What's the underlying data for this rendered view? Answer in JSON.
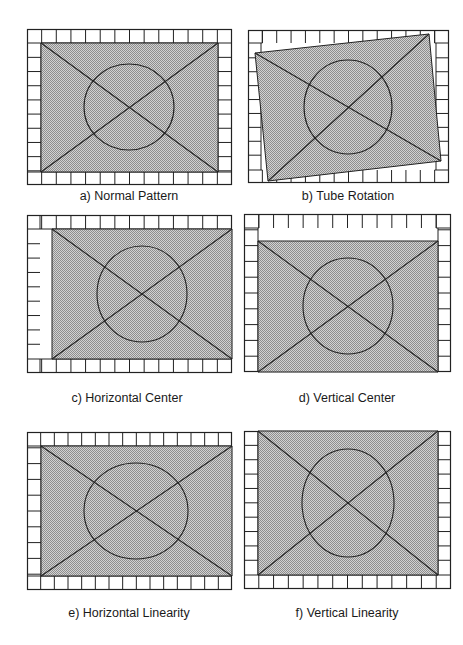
{
  "figure": {
    "fill_color": "#b4b4b4",
    "line_color": "#222222",
    "panels": [
      {
        "id": "a",
        "caption": "a) Normal Pattern",
        "caption_pos": [
          129,
          189
        ],
        "outer": [
          27,
          29,
          232,
          185
        ],
        "inner_poly": [
          [
            41,
            43
          ],
          [
            218,
            43
          ],
          [
            218,
            172
          ],
          [
            41,
            172
          ]
        ],
        "circle": {
          "cx": 129,
          "cy": 107,
          "rx": 45,
          "ry": 43
        },
        "grid": {
          "top": [
            29,
            43
          ],
          "bottom": [
            172,
            185
          ],
          "left": [
            27,
            41
          ],
          "right": [
            218,
            232
          ],
          "cols": 14,
          "rows": 11,
          "open": []
        }
      },
      {
        "id": "b",
        "caption": "b) Tube Rotation",
        "caption_pos": [
          348,
          189
        ],
        "outer": [
          248,
          30,
          449,
          183
        ],
        "inner_poly": [
          [
            255,
            53
          ],
          [
            429,
            34
          ],
          [
            441,
            161
          ],
          [
            268,
            181
          ]
        ],
        "circle": {
          "cx": 348,
          "cy": 107,
          "rx": 44,
          "ry": 47
        },
        "grid": {
          "top": [
            30,
            43
          ],
          "bottom": [
            170,
            183
          ],
          "left": [
            248,
            261
          ],
          "right": [
            436,
            449
          ],
          "cols": 14,
          "rows": 11,
          "open": [
            "ticks-top-inner",
            "ticks-bottom-inner"
          ]
        }
      },
      {
        "id": "c",
        "caption": "c) Horizontal Center",
        "caption_pos": [
          127,
          391
        ],
        "outer": [
          27,
          215,
          232,
          373
        ],
        "inner_poly": [
          [
            52,
            229
          ],
          [
            232,
            229
          ],
          [
            232,
            359
          ],
          [
            52,
            359
          ]
        ],
        "circle": {
          "cx": 142,
          "cy": 294,
          "rx": 45,
          "ry": 48
        },
        "grid": {
          "top": [
            215,
            229
          ],
          "bottom": [
            359,
            373
          ],
          "left": [
            27,
            40
          ],
          "right": null,
          "cols": 14,
          "rows": 11,
          "open": [
            "ticks-left"
          ]
        }
      },
      {
        "id": "d",
        "caption": "d) Vertical Center",
        "caption_pos": [
          347,
          391
        ],
        "outer": [
          244,
          214,
          451,
          372
        ],
        "inner_poly": [
          [
            258,
            241
          ],
          [
            438,
            241
          ],
          [
            438,
            372
          ],
          [
            258,
            372
          ]
        ],
        "circle": {
          "cx": 348,
          "cy": 306,
          "rx": 45,
          "ry": 48
        },
        "grid": {
          "top": [
            214,
            228
          ],
          "bottom": null,
          "left": [
            244,
            258
          ],
          "right": [
            438,
            451
          ],
          "cols": 14,
          "rows": 10,
          "open": [
            "ticks-top"
          ]
        }
      },
      {
        "id": "e",
        "caption": "e) Horizontal Linearity",
        "caption_pos": [
          129,
          606
        ],
        "outer": [
          27,
          432,
          232,
          590
        ],
        "inner_poly": [
          [
            41,
            446
          ],
          [
            232,
            446
          ],
          [
            232,
            576
          ],
          [
            41,
            576
          ]
        ],
        "circle": {
          "cx": 136,
          "cy": 511,
          "rx": 52,
          "ry": 48
        },
        "grid": {
          "top": [
            432,
            446
          ],
          "bottom": [
            576,
            590
          ],
          "left": [
            27,
            41
          ],
          "right": null,
          "cols": 15,
          "rows": 10,
          "open": []
        }
      },
      {
        "id": "f",
        "caption": "f) Vertical Linearity",
        "caption_pos": [
          347,
          606
        ],
        "outer": [
          244,
          431,
          451,
          589
        ],
        "inner_poly": [
          [
            258,
            431
          ],
          [
            438,
            431
          ],
          [
            438,
            575
          ],
          [
            258,
            575
          ]
        ],
        "circle": {
          "cx": 348,
          "cy": 503,
          "rx": 46,
          "ry": 54
        },
        "grid": {
          "top": null,
          "bottom": [
            575,
            589
          ],
          "left": [
            244,
            258
          ],
          "right": [
            438,
            451
          ],
          "cols": 14,
          "rows": 11,
          "open": []
        }
      }
    ]
  }
}
